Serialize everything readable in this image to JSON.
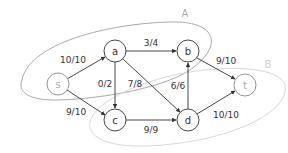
{
  "diagram": {
    "type": "flow-network",
    "colors": {
      "cut_A": "#aaaaaa",
      "cut_B": "#d8d8d8",
      "edge": "#333333"
    },
    "cuts": [
      {
        "label": "A",
        "x": 185,
        "y": 17
      },
      {
        "label": "B",
        "x": 268,
        "y": 68
      }
    ],
    "nodes": [
      {
        "id": "s",
        "label": "s",
        "x": 58,
        "y": 84
      },
      {
        "id": "a",
        "label": "a",
        "x": 115,
        "y": 51
      },
      {
        "id": "b",
        "label": "b",
        "x": 188,
        "y": 51
      },
      {
        "id": "c",
        "label": "c",
        "x": 115,
        "y": 120
      },
      {
        "id": "d",
        "label": "d",
        "x": 188,
        "y": 120
      },
      {
        "id": "t",
        "label": "t",
        "x": 245,
        "y": 85
      }
    ],
    "edges": [
      {
        "from": "s",
        "to": "a",
        "label": "10/10"
      },
      {
        "from": "s",
        "to": "c",
        "label": "9/10"
      },
      {
        "from": "a",
        "to": "b",
        "label": "3/4"
      },
      {
        "from": "a",
        "to": "c",
        "label": "0/2"
      },
      {
        "from": "a",
        "to": "d",
        "label": "7/8"
      },
      {
        "from": "d",
        "to": "b",
        "label": "6/6"
      },
      {
        "from": "c",
        "to": "d",
        "label": "9/9"
      },
      {
        "from": "b",
        "to": "t",
        "label": "9/10"
      },
      {
        "from": "d",
        "to": "t",
        "label": "10/10"
      }
    ]
  }
}
